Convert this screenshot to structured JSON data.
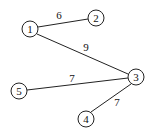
{
  "graph": {
    "nodes": [
      {
        "id": "1",
        "label": "1",
        "x": 30,
        "y": 29
      },
      {
        "id": "2",
        "label": "2",
        "x": 96,
        "y": 18
      },
      {
        "id": "3",
        "label": "3",
        "x": 136,
        "y": 77
      },
      {
        "id": "4",
        "label": "4",
        "x": 86,
        "y": 119
      },
      {
        "id": "5",
        "label": "5",
        "x": 19,
        "y": 91
      }
    ],
    "edges": [
      {
        "from": "1",
        "to": "2",
        "weight": "6"
      },
      {
        "from": "1",
        "to": "3",
        "weight": "9"
      },
      {
        "from": "5",
        "to": "3",
        "weight": "7"
      },
      {
        "from": "4",
        "to": "3",
        "weight": "7"
      }
    ]
  }
}
